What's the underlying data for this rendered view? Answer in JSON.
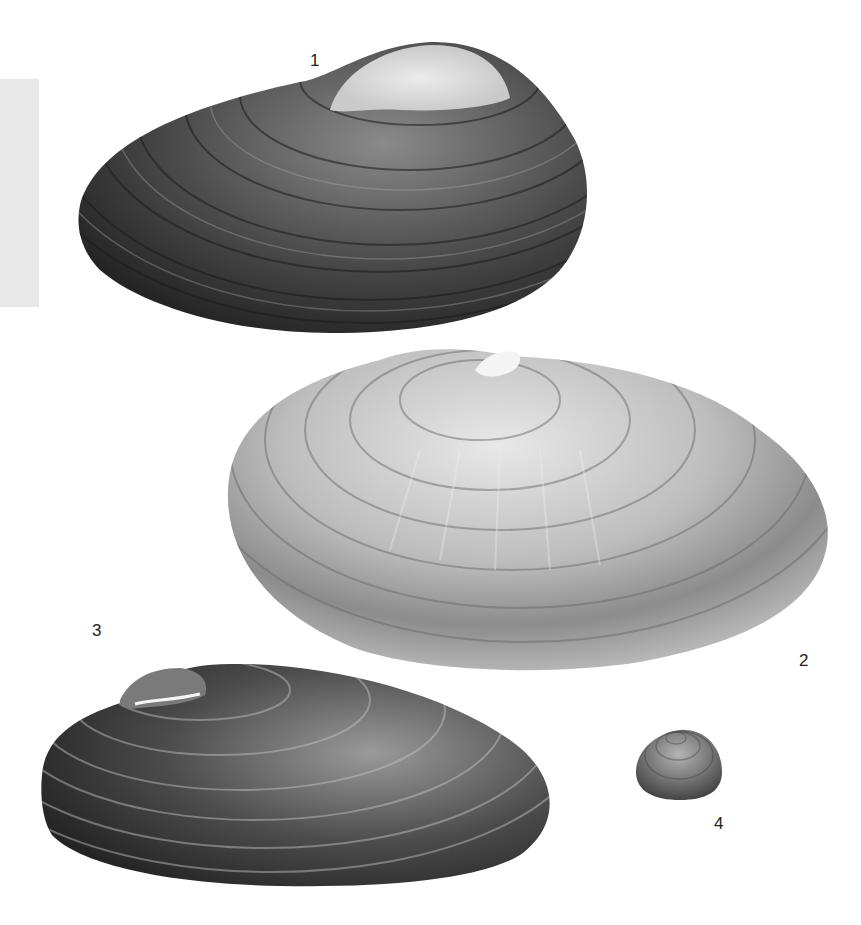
{
  "plate": {
    "background": "#ffffff",
    "side_tab_color": "#e8e8e8"
  },
  "figures": [
    {
      "label": "1",
      "subject": "bivalve-shell-dark-elongate",
      "tone": "dark"
    },
    {
      "label": "2",
      "subject": "bivalve-shell-pale-large",
      "tone": "light"
    },
    {
      "label": "3",
      "subject": "bivalve-shell-dark-narrow",
      "tone": "dark"
    },
    {
      "label": "4",
      "subject": "bivalve-shell-small-round",
      "tone": "medium"
    }
  ]
}
